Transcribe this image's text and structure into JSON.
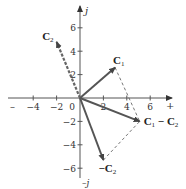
{
  "diagram": {
    "title": "",
    "origin_px": [
      80,
      98
    ],
    "unit_px": 11.7,
    "axes": {
      "x_positive_label": "+",
      "x_negative_label": "–",
      "y_positive_label": "j",
      "y_negative_label": "–j",
      "x_ticks": [
        {
          "value": -4,
          "label": "−4"
        },
        {
          "value": -2,
          "label": "−2"
        },
        {
          "value": 0,
          "label": "0"
        },
        {
          "value": 2,
          "label": "2"
        },
        {
          "value": 4,
          "label": "4"
        },
        {
          "value": 6,
          "label": "6"
        }
      ],
      "y_ticks": [
        {
          "value": 6,
          "label": "6"
        },
        {
          "value": 4,
          "label": "4"
        },
        {
          "value": 2,
          "label": "2"
        },
        {
          "value": -2,
          "label": "−2"
        },
        {
          "value": -4,
          "label": "−4"
        },
        {
          "value": -6,
          "label": "−6"
        }
      ]
    },
    "vectors": [
      {
        "name": "C1",
        "label_main": "C",
        "label_sub": "1",
        "tip": [
          3,
          2.6
        ],
        "style": "solid",
        "color": "#555555"
      },
      {
        "name": "C2",
        "label_main": "C",
        "label_sub": "2",
        "tip": [
          -2,
          4.8
        ],
        "style": "dashed",
        "color": "#666666"
      },
      {
        "name": "-C2",
        "label_main": "−C",
        "label_sub": "2",
        "tip": [
          2,
          -5.3
        ],
        "style": "solid",
        "color": "#555555"
      },
      {
        "name": "C1-C2",
        "label_main": "C",
        "label_sub": "1",
        "label_tail": " − C",
        "label_tail_sub": "2",
        "tip": [
          5.1,
          -2
        ],
        "style": "solid",
        "color": "#555555"
      }
    ],
    "construction_lines": [
      {
        "from": "C1",
        "to": "C1-C2",
        "style": "dashed"
      },
      {
        "from": "-C2",
        "to": "C1-C2",
        "style": "dashed"
      }
    ]
  }
}
